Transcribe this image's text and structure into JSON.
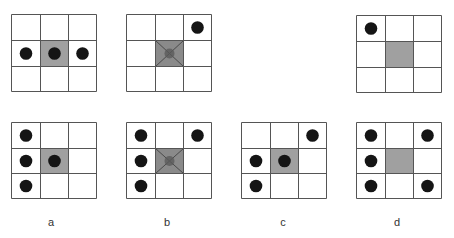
{
  "figure": {
    "colors": {
      "grid_line": "#555555",
      "center_fill": "#a0a0a0",
      "center_fill_marked": "#8a8a8a",
      "dot": "#151515",
      "label_text": "#333333"
    },
    "grids": [
      {
        "id": "top-a",
        "position": "top-row, column a",
        "center_marked": false,
        "dots": [
          [
            1,
            0
          ],
          [
            1,
            1
          ],
          [
            1,
            2
          ]
        ]
      },
      {
        "id": "top-b",
        "position": "top-row, column b",
        "center_marked": true,
        "dots": [
          [
            0,
            2
          ]
        ]
      },
      {
        "id": "top-d",
        "position": "top-row, column d",
        "center_marked": false,
        "dots": [
          [
            0,
            0
          ]
        ]
      },
      {
        "id": "bottom-a",
        "position": "bottom-row, column a",
        "center_marked": false,
        "dots": [
          [
            0,
            0
          ],
          [
            1,
            0
          ],
          [
            2,
            0
          ],
          [
            1,
            1
          ]
        ]
      },
      {
        "id": "bottom-b",
        "position": "bottom-row, column b",
        "center_marked": true,
        "dots": [
          [
            0,
            0
          ],
          [
            1,
            0
          ],
          [
            2,
            0
          ],
          [
            0,
            2
          ]
        ]
      },
      {
        "id": "bottom-c",
        "position": "bottom-row, column c",
        "center_marked": false,
        "dots": [
          [
            0,
            2
          ],
          [
            1,
            0
          ],
          [
            2,
            0
          ],
          [
            1,
            1
          ]
        ]
      },
      {
        "id": "bottom-d",
        "position": "bottom-row, column d",
        "center_marked": false,
        "dots": [
          [
            0,
            0
          ],
          [
            0,
            2
          ],
          [
            1,
            0
          ],
          [
            2,
            0
          ],
          [
            2,
            2
          ]
        ]
      }
    ],
    "labels": [
      "a",
      "b",
      "c",
      "d"
    ]
  }
}
